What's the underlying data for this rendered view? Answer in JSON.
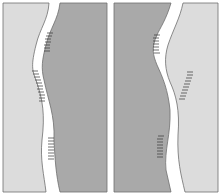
{
  "figure": {
    "colors": {
      "light": "#dcdcdc",
      "dark": "#a9a9a9",
      "gap": "#ffffff",
      "outline": "#6e6e6e",
      "hatch": "#333333"
    },
    "panels": [
      {
        "name": "left-pair",
        "left_shade": "light",
        "right_shade": "dark"
      },
      {
        "name": "right-pair",
        "left_shade": "dark",
        "right_shade": "light"
      }
    ]
  }
}
